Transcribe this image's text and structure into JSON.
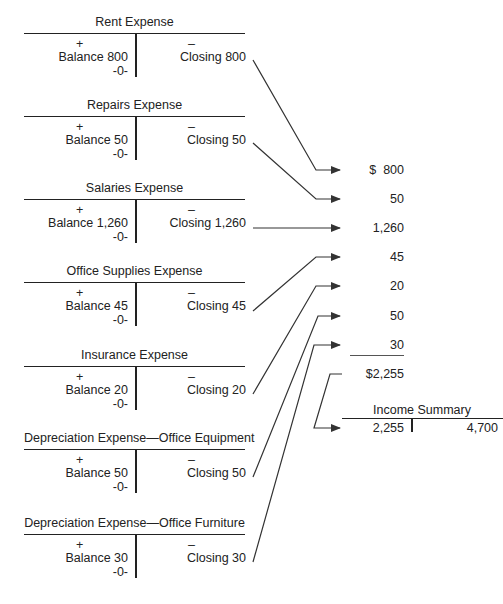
{
  "accounts": [
    {
      "title": "Rent Expense",
      "debit_sign": "+",
      "credit_sign": "–",
      "balance": "Balance 800",
      "closing": "Closing 800",
      "zero": "-0-"
    },
    {
      "title": "Repairs Expense",
      "debit_sign": "+",
      "credit_sign": "–",
      "balance": "Balance 50",
      "closing": "Closing 50",
      "zero": "-0-"
    },
    {
      "title": "Salaries Expense",
      "debit_sign": "+",
      "credit_sign": "–",
      "balance": "Balance 1,260",
      "closing": "Closing 1,260",
      "zero": "-0-"
    },
    {
      "title": "Office Supplies Expense",
      "debit_sign": "+",
      "credit_sign": "–",
      "balance": "Balance 45",
      "closing": "Closing 45",
      "zero": "-0-"
    },
    {
      "title": "Insurance Expense",
      "debit_sign": "+",
      "credit_sign": "–",
      "balance": "Balance 20",
      "closing": "Closing 20",
      "zero": "-0-"
    },
    {
      "title": "Depreciation Expense—Office Equipment",
      "debit_sign": "+",
      "credit_sign": "–",
      "balance": "Balance 50",
      "closing": "Closing 50",
      "zero": "-0-"
    },
    {
      "title": "Depreciation Expense—Office Furniture",
      "debit_sign": "+",
      "credit_sign": "–",
      "balance": "Balance 30",
      "closing": "Closing 30",
      "zero": "-0-"
    }
  ],
  "summary_column": {
    "values": [
      "$  800",
      "50",
      "1,260",
      "45",
      "20",
      "50",
      "30"
    ],
    "total": "$2,255"
  },
  "income_summary": {
    "title": "Income Summary",
    "debit": "2,255",
    "credit": "4,700"
  },
  "colors": {
    "ink": "#222222",
    "background": "#ffffff"
  }
}
